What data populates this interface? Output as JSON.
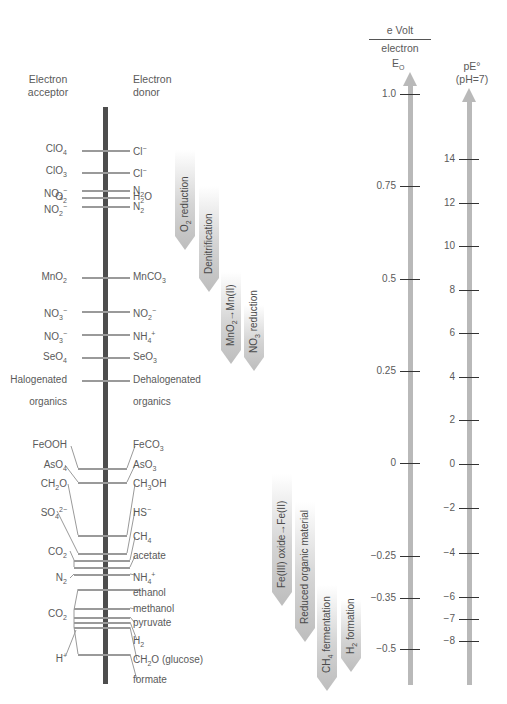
{
  "headers": {
    "acceptor": [
      "Electron",
      "acceptor"
    ],
    "donor": [
      "Electron",
      "donor"
    ],
    "unit_top": "e Volt",
    "unit_bottom": "electron",
    "eo_label": "E",
    "eo_sub": "O",
    "pe_label": "pE°",
    "pe_sub": "(pH=7)"
  },
  "couples": [
    {
      "acceptor": "ClO4",
      "acc_sub": "4",
      "donor": "Cl",
      "don_sup": "−",
      "y": 148
    },
    {
      "acceptor": "ClO3",
      "acc_sub": "3",
      "donor": "Cl",
      "don_sup": "−",
      "y": 170
    },
    {
      "acceptor": "O2",
      "acc_sub": "2",
      "donor": "H2O",
      "y": 196
    },
    {
      "acceptor": "NO3−",
      "donor": "N2",
      "y": 190
    },
    {
      "acceptor": "NO2−",
      "donor": "N2",
      "y": 206
    },
    {
      "acceptor": "MnO2",
      "donor": "MnCO3",
      "y": 276
    },
    {
      "acceptor": "NO3−",
      "donor": "NO2−",
      "y": 310
    },
    {
      "acceptor": "NO3−",
      "donor": "NH4+",
      "y": 333
    },
    {
      "acceptor": "SeO4",
      "donor": "SeO3",
      "y": 356
    },
    {
      "acceptor": "Halogenated organics",
      "donor": "Dehalogenated organics",
      "y": 380
    }
  ],
  "acceptors": [
    {
      "base": "ClO",
      "sub": "4",
      "sup": "",
      "y": 143
    },
    {
      "base": "ClO",
      "sub": "3",
      "sup": "",
      "y": 165
    },
    {
      "base": "O",
      "sub": "2",
      "sup": "",
      "y": 191
    },
    {
      "base": "NO",
      "sub": "3",
      "sup": "−",
      "y": 185
    },
    {
      "base": "NO",
      "sub": "2",
      "sup": "−",
      "y": 201
    },
    {
      "base": "MnO",
      "sub": "2",
      "sup": "",
      "y": 271
    },
    {
      "base": "NO",
      "sub": "3",
      "sup": "−",
      "y": 305
    },
    {
      "base": "NO",
      "sub": "3",
      "sup": "−",
      "y": 328
    },
    {
      "base": "SeO",
      "sub": "4",
      "sup": "",
      "y": 351
    },
    {
      "base": "Halogenated",
      "sub": "",
      "sup": "",
      "y": 374
    },
    {
      "base": "organics",
      "sub": "",
      "sup": "",
      "y": 396
    },
    {
      "base": "FeOOH",
      "sub": "",
      "sup": "",
      "y": 439
    },
    {
      "base": "AsO",
      "sub": "4",
      "sup": "",
      "y": 459
    },
    {
      "base": "CH",
      "sub": "2",
      "sup": "",
      "tail": "O",
      "y": 478
    },
    {
      "base": "SO",
      "sub": "4",
      "sup": "2−",
      "y": 504
    },
    {
      "base": "CO",
      "sub": "2",
      "sup": "",
      "y": 546
    },
    {
      "base": "N",
      "sub": "2",
      "sup": "",
      "y": 572
    },
    {
      "base": "CO",
      "sub": "2",
      "sup": "",
      "y": 608
    },
    {
      "base": "H",
      "sub": "",
      "sup": "+",
      "y": 650
    }
  ],
  "donors": [
    {
      "base": "Cl",
      "sub": "",
      "sup": "−",
      "y": 143
    },
    {
      "base": "Cl",
      "sub": "",
      "sup": "−",
      "y": 165
    },
    {
      "base": "H",
      "sub": "2",
      "sup": "",
      "tail": "O",
      "y": 191
    },
    {
      "base": "N",
      "sub": "2",
      "sup": "",
      "y": 185
    },
    {
      "base": "N",
      "sub": "2",
      "sup": "",
      "y": 201
    },
    {
      "base": "MnCO",
      "sub": "3",
      "sup": "",
      "y": 271
    },
    {
      "base": "NO",
      "sub": "2",
      "sup": "−",
      "y": 305
    },
    {
      "base": "NH",
      "sub": "4",
      "sup": "+",
      "y": 328
    },
    {
      "base": "SeO",
      "sub": "3",
      "sup": "",
      "y": 351
    },
    {
      "base": "Dehalogenated",
      "sub": "",
      "sup": "",
      "y": 374
    },
    {
      "base": "organics",
      "sub": "",
      "sup": "",
      "y": 396
    },
    {
      "base": "FeCO",
      "sub": "3",
      "sup": "",
      "y": 439
    },
    {
      "base": "AsO",
      "sub": "3",
      "sup": "",
      "y": 459
    },
    {
      "base": "CH",
      "sub": "3",
      "sup": "",
      "tail": "OH",
      "y": 478
    },
    {
      "base": "HS",
      "sub": "",
      "sup": "−",
      "y": 504
    },
    {
      "base": "CH",
      "sub": "4",
      "sup": "",
      "y": 531
    },
    {
      "base": "acetate",
      "sub": "",
      "sup": "",
      "y": 550
    },
    {
      "base": "NH",
      "sub": "4",
      "sup": "+",
      "y": 569
    },
    {
      "base": "ethanol",
      "sub": "",
      "sup": "",
      "y": 587
    },
    {
      "base": "methanol",
      "sub": "",
      "sup": "",
      "y": 603
    },
    {
      "base": "pyruvate",
      "sub": "",
      "sup": "",
      "y": 617
    },
    {
      "base": "H",
      "sub": "2",
      "sup": "",
      "y": 635
    },
    {
      "base": "CH",
      "sub": "2",
      "sup": "",
      "tail": "O (glucose)",
      "y": 654
    },
    {
      "base": "formate",
      "sub": "",
      "sup": "",
      "y": 674
    }
  ],
  "rungs": [
    {
      "y": 150,
      "x1": 82,
      "x2": 130
    },
    {
      "y": 172,
      "x1": 82,
      "x2": 130
    },
    {
      "y": 197,
      "x1": 82,
      "x2": 130
    },
    {
      "y": 190,
      "x1": 82,
      "x2": 130
    },
    {
      "y": 206,
      "x1": 82,
      "x2": 130
    },
    {
      "y": 277,
      "x1": 82,
      "x2": 130
    },
    {
      "y": 311,
      "x1": 82,
      "x2": 130
    },
    {
      "y": 334,
      "x1": 82,
      "x2": 130
    },
    {
      "y": 357,
      "x1": 82,
      "x2": 130
    },
    {
      "y": 380,
      "x1": 82,
      "x2": 130
    },
    {
      "y": 468,
      "x1": 78,
      "x2": 127
    },
    {
      "y": 482,
      "x1": 78,
      "x2": 127
    },
    {
      "y": 535,
      "x1": 78,
      "x2": 127
    },
    {
      "y": 553,
      "x1": 78,
      "x2": 127
    },
    {
      "y": 560,
      "x1": 74,
      "x2": 130
    },
    {
      "y": 567,
      "x1": 74,
      "x2": 130
    },
    {
      "y": 574,
      "x1": 74,
      "x2": 130
    },
    {
      "y": 589,
      "x1": 78,
      "x2": 140
    },
    {
      "y": 608,
      "x1": 74,
      "x2": 130
    },
    {
      "y": 617,
      "x1": 74,
      "x2": 130
    },
    {
      "y": 622,
      "x1": 74,
      "x2": 130
    },
    {
      "y": 627,
      "x1": 74,
      "x2": 130
    },
    {
      "y": 654,
      "x1": 78,
      "x2": 130
    }
  ],
  "processes": [
    {
      "label": "O2 reduction",
      "base": "O",
      "sub": "2",
      "tail": " reduction",
      "x": 175,
      "top": 150,
      "height": 100
    },
    {
      "label": "Denitrification",
      "base": "Denitrification",
      "sub": "",
      "tail": "",
      "x": 199,
      "top": 186,
      "height": 106
    },
    {
      "label": "MnO2→Mn(II)",
      "base": "MnO",
      "sub": "2",
      "tail": "→Mn(II)",
      "x": 221,
      "top": 272,
      "height": 92
    },
    {
      "label": "NO3 reduction",
      "base": "NO",
      "sub": "3",
      "tail": " reduction",
      "x": 244,
      "top": 305,
      "height": 66
    },
    {
      "label": "Fe(III) oxide→Fe(II)",
      "base": "Fe(III) oxide→Fe(II)",
      "sub": "",
      "tail": "",
      "x": 272,
      "top": 474,
      "height": 132
    },
    {
      "label": "Reduced organic material",
      "base": "Reduced organic material",
      "sub": "",
      "tail": "",
      "x": 295,
      "top": 502,
      "height": 140
    },
    {
      "label": "CH4 fermentation",
      "base": "CH",
      "sub": "4",
      "tail": " fermentation",
      "x": 317,
      "top": 585,
      "height": 106
    },
    {
      "label": "H2 formation",
      "base": "H",
      "sub": "2",
      "tail": " formation",
      "x": 341,
      "top": 600,
      "height": 72
    }
  ],
  "eo_axis": {
    "x": 410,
    "top": 72,
    "bottom": 685,
    "ticks": [
      {
        "label": "1.0",
        "y": 94
      },
      {
        "label": "0.75",
        "y": 186
      },
      {
        "label": "0.5",
        "y": 279
      },
      {
        "label": "0.25",
        "y": 371
      },
      {
        "label": "0",
        "y": 463
      },
      {
        "label": "−0.25",
        "y": 556
      },
      {
        "label": "−0.35",
        "y": 598
      },
      {
        "label": "−0.5",
        "y": 649
      }
    ]
  },
  "pe_axis": {
    "x": 469,
    "top": 88,
    "bottom": 685,
    "ticks": [
      {
        "label": "14",
        "y": 159
      },
      {
        "label": "12",
        "y": 203
      },
      {
        "label": "10",
        "y": 246
      },
      {
        "label": "8",
        "y": 290
      },
      {
        "label": "6",
        "y": 333
      },
      {
        "label": "4",
        "y": 377
      },
      {
        "label": "2",
        "y": 420
      },
      {
        "label": "0",
        "y": 464
      },
      {
        "label": "−2",
        "y": 508
      },
      {
        "label": "−4",
        "y": 553
      },
      {
        "label": "−6",
        "y": 597
      },
      {
        "label": "−7",
        "y": 619
      },
      {
        "label": "−8",
        "y": 641
      }
    ]
  },
  "chart_data": {
    "type": "table",
    "columns": [
      "Electron acceptor",
      "Electron donor"
    ],
    "rows": [
      [
        "ClO4",
        "Cl−"
      ],
      [
        "ClO3",
        "Cl−"
      ],
      [
        "O2",
        "H2O"
      ],
      [
        "NO3−",
        "N2"
      ],
      [
        "NO2−",
        "N2"
      ],
      [
        "MnO2",
        "MnCO3"
      ],
      [
        "NO3−",
        "NO2−"
      ],
      [
        "NO3−",
        "NH4+"
      ],
      [
        "SeO4",
        "SeO3"
      ],
      [
        "Halogenated organics",
        "Dehalogenated organics"
      ],
      [
        "FeOOH",
        "FeCO3"
      ],
      [
        "AsO4",
        "AsO3"
      ],
      [
        "CH2O",
        "CH3OH"
      ],
      [
        "SO4 2−",
        "HS−"
      ],
      [
        "CO2",
        "CH4"
      ],
      [
        "CO2",
        "acetate"
      ],
      [
        "N2",
        "NH4+"
      ],
      [
        "CO2",
        "ethanol"
      ],
      [
        "CO2",
        "methanol"
      ],
      [
        "CO2",
        "pyruvate"
      ],
      [
        "H+",
        "H2"
      ],
      [
        "CO2",
        "CH2O (glucose)"
      ],
      [
        "CO2",
        "formate"
      ]
    ],
    "axes": [
      {
        "name": "E0",
        "unit": "e Volt / electron",
        "ticks": [
          1.0,
          0.75,
          0.5,
          0.25,
          0,
          -0.25,
          -0.35,
          -0.5
        ]
      },
      {
        "name": "pE° (pH=7)",
        "ticks": [
          14,
          12,
          10,
          8,
          6,
          4,
          2,
          0,
          -2,
          -4,
          -6,
          -7,
          -8
        ]
      }
    ],
    "processes": [
      "O2 reduction",
      "Denitrification",
      "MnO2→Mn(II)",
      "NO3 reduction",
      "Fe(III) oxide→Fe(II)",
      "Reduced organic material",
      "CH4 fermentation",
      "H2 formation"
    ]
  }
}
